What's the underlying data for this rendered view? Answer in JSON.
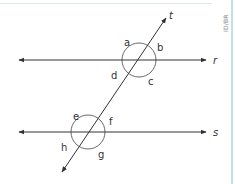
{
  "diagram": {
    "credit": "ID/BR",
    "lines": [
      {
        "name": "r",
        "label": "r",
        "type": "parallel"
      },
      {
        "name": "s",
        "label": "s",
        "type": "parallel"
      },
      {
        "name": "t",
        "label": "t",
        "type": "transversal"
      }
    ],
    "angles": {
      "intersection_r": [
        "a",
        "b",
        "c",
        "d"
      ],
      "intersection_s": [
        "e",
        "f",
        "g",
        "h"
      ]
    },
    "labels": {
      "line_r": "r",
      "line_s": "s",
      "line_t": "t",
      "a": "a",
      "b": "b",
      "c": "c",
      "d": "d",
      "e": "e",
      "f": "f",
      "g": "g",
      "h": "h"
    },
    "colors": {
      "line": "#333333",
      "border_accent": "#bfe3e3"
    }
  }
}
